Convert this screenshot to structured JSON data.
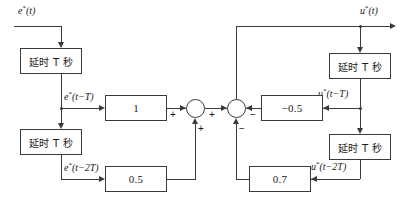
{
  "diagram": {
    "signals": {
      "input": "e*(t)",
      "input_d1": "e*(t−T)",
      "input_d2": "e*(t−2T)",
      "output": "u*(t)",
      "output_d1": "u*(t−T)",
      "output_d2": "u*(t−2T)"
    },
    "blocks": {
      "delay_in_1": "延时 T 秒",
      "delay_in_2": "延时 T 秒",
      "delay_out_1": "延时 T 秒",
      "delay_out_2": "延时 T 秒",
      "gain_1": "1",
      "gain_05": "0.5",
      "gain_neg05": "−0.5",
      "gain_07": "0.7"
    },
    "signs": {
      "sum1_top": "+",
      "sum1_bottom": "+",
      "sum2_left": "+",
      "sum2_right": "−",
      "sum2_bottom": "−",
      "sum2_right_lower": "−"
    },
    "colors": {
      "line": "#3b3b3b",
      "text": "#1a1a1a",
      "background": "#ffffff"
    }
  }
}
